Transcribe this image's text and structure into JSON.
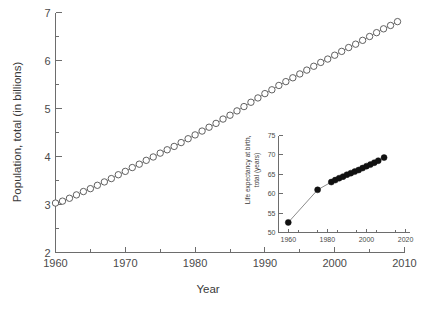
{
  "chart_data": [
    {
      "id": "main",
      "type": "line",
      "title": "",
      "xlabel": "Year",
      "ylabel": "Population, total (in billions)",
      "xlim": [
        1960,
        2010
      ],
      "ylim": [
        2,
        7
      ],
      "xticks": [
        1960,
        1970,
        1980,
        1990,
        2000,
        2010
      ],
      "xticklabels": [
        "1960",
        "1970",
        "1980",
        "1990",
        "2000",
        "2010"
      ],
      "xminor_step": 5,
      "yticks": [
        2,
        3,
        4,
        5,
        6,
        7
      ],
      "yticklabels": [
        "2",
        "3",
        "4",
        "5",
        "6",
        "7"
      ],
      "yminor_step": 0.5,
      "grid": false,
      "legend": "none",
      "marker": "open-circle",
      "x": [
        1960,
        1961,
        1962,
        1963,
        1964,
        1965,
        1966,
        1967,
        1968,
        1969,
        1970,
        1971,
        1972,
        1973,
        1974,
        1975,
        1976,
        1977,
        1978,
        1979,
        1980,
        1981,
        1982,
        1983,
        1984,
        1985,
        1986,
        1987,
        1988,
        1989,
        1990,
        1991,
        1992,
        1993,
        1994,
        1995,
        1996,
        1997,
        1998,
        1999,
        2000,
        2001,
        2002,
        2003,
        2004,
        2005,
        2006,
        2007,
        2008,
        2009
      ],
      "values": [
        3.03,
        3.07,
        3.13,
        3.2,
        3.27,
        3.33,
        3.4,
        3.47,
        3.54,
        3.62,
        3.69,
        3.77,
        3.84,
        3.92,
        3.99,
        4.07,
        4.14,
        4.21,
        4.29,
        4.37,
        4.45,
        4.53,
        4.61,
        4.69,
        4.78,
        4.86,
        4.95,
        5.04,
        5.13,
        5.22,
        5.31,
        5.39,
        5.48,
        5.56,
        5.64,
        5.72,
        5.8,
        5.88,
        5.96,
        6.03,
        6.11,
        6.19,
        6.27,
        6.34,
        6.42,
        6.5,
        6.58,
        6.66,
        6.73,
        6.81
      ]
    },
    {
      "id": "inset",
      "type": "line",
      "title": "",
      "xlabel": "",
      "ylabel": "Life expectancy at birth, total (years)",
      "ylabel_line1": "Life expectancy at birth,",
      "ylabel_line2": "total (years)",
      "xlim": [
        1955,
        2022
      ],
      "ylim": [
        50,
        75
      ],
      "xticks": [
        1960,
        1980,
        2000,
        2020
      ],
      "xticklabels": [
        "1960",
        "1980",
        "2000",
        "2020"
      ],
      "xminor_step": 10,
      "yticks": [
        50,
        55,
        60,
        65,
        70,
        75
      ],
      "yticklabels": [
        "50",
        "55",
        "60",
        "65",
        "70",
        "75"
      ],
      "grid": false,
      "legend": "none",
      "marker": "filled-circle",
      "x": [
        1960,
        1975,
        1982,
        1984,
        1986,
        1988,
        1990,
        1992,
        1994,
        1996,
        1998,
        2000,
        2002,
        2004,
        2006,
        2009
      ],
      "values": [
        52.6,
        61.0,
        63.0,
        63.5,
        64.0,
        64.4,
        64.9,
        65.3,
        65.7,
        66.1,
        66.6,
        67.1,
        67.5,
        68.0,
        68.5,
        69.3
      ]
    }
  ]
}
